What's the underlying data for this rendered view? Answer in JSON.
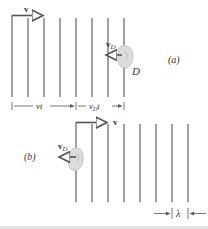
{
  "figure": {
    "panel_a": {
      "label": "(a)",
      "velocity_label": "v",
      "detector_velocity_label": "v",
      "detector_velocity_sub": "D",
      "detector_label": "D",
      "dim_vt": "vt",
      "dim_vdt_main": "v",
      "dim_vdt_sub": "D",
      "dim_vdt_t": "t"
    },
    "panel_b": {
      "label": "(b)",
      "velocity_label": "v",
      "detector_velocity_label": "v",
      "detector_velocity_sub": "D",
      "wavelength_label": "λ"
    },
    "caption_partial": "F...  Wavefronts ... detector ... (cut off)",
    "colors": {
      "wavefront": "#8a8a8a",
      "arrow": "#555555",
      "ear": "#d8d8d8",
      "text": "#333333"
    }
  }
}
